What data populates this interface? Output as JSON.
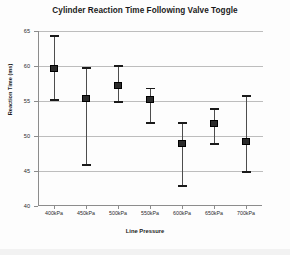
{
  "chart_data": {
    "type": "scatter",
    "title": "Cylinder Reaction Time Following Valve Toggle",
    "xlabel": "Line Pressure",
    "ylabel": "Reaction Time (ms)",
    "categories": [
      "400kPa",
      "450kPa",
      "500kPa",
      "550kPa",
      "600kPa",
      "650kPa",
      "700kPa"
    ],
    "values": [
      59.6,
      55.4,
      57.2,
      55.2,
      48.9,
      51.8,
      49.2
    ],
    "error_upper": [
      64.3,
      59.7,
      60.0,
      56.8,
      51.9,
      53.9,
      55.7
    ],
    "error_lower": [
      55.1,
      45.9,
      54.9,
      51.9,
      42.9,
      48.9,
      44.9
    ],
    "ylim": [
      40,
      65
    ],
    "ytick_labels": [
      "65",
      "60",
      "55",
      "50",
      "45",
      "40"
    ],
    "ytick_values": [
      65,
      60,
      55,
      50,
      45,
      40
    ],
    "grid": true,
    "legend": "none",
    "series": [
      {
        "name": "Reaction Time",
        "values": [
          59.6,
          55.4,
          57.2,
          55.2,
          48.9,
          51.8,
          49.2
        ],
        "error_upper": [
          64.3,
          59.7,
          60.0,
          56.8,
          51.9,
          53.9,
          55.7
        ],
        "error_lower": [
          55.1,
          45.9,
          54.9,
          51.9,
          42.9,
          48.9,
          44.9
        ]
      }
    ],
    "colors": {
      "marker": "#2b2b2b",
      "whisker": "#4d4d4d",
      "grid": "#bdbdbd",
      "axis": "#8c8c8c",
      "text": "#1b1b1b",
      "background": "#fdfdfd"
    }
  }
}
